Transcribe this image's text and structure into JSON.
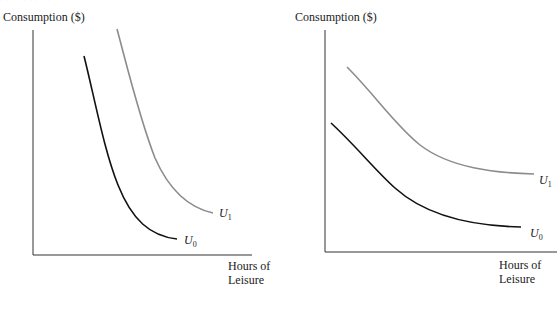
{
  "header": {
    "faint_caption": "· · · · · · · · ·"
  },
  "panels": [
    {
      "id": "left",
      "ylabel": "Consumption ($)",
      "xlabel_line1": "Hours of",
      "xlabel_line2": "Leisure",
      "curves": [
        {
          "name": "U",
          "sub": "0",
          "color": "#111111"
        },
        {
          "name": "U",
          "sub": "1",
          "color": "#8c8c8c"
        }
      ]
    },
    {
      "id": "right",
      "ylabel": "Consumption ($)",
      "xlabel_line1": "Hours of",
      "xlabel_line2": "Leisure",
      "curves": [
        {
          "name": "U",
          "sub": "0",
          "color": "#111111"
        },
        {
          "name": "U",
          "sub": "1",
          "color": "#8c8c8c"
        }
      ]
    }
  ],
  "colors": {
    "axis": "#333333",
    "u0": "#111111",
    "u1": "#8c8c8c"
  }
}
